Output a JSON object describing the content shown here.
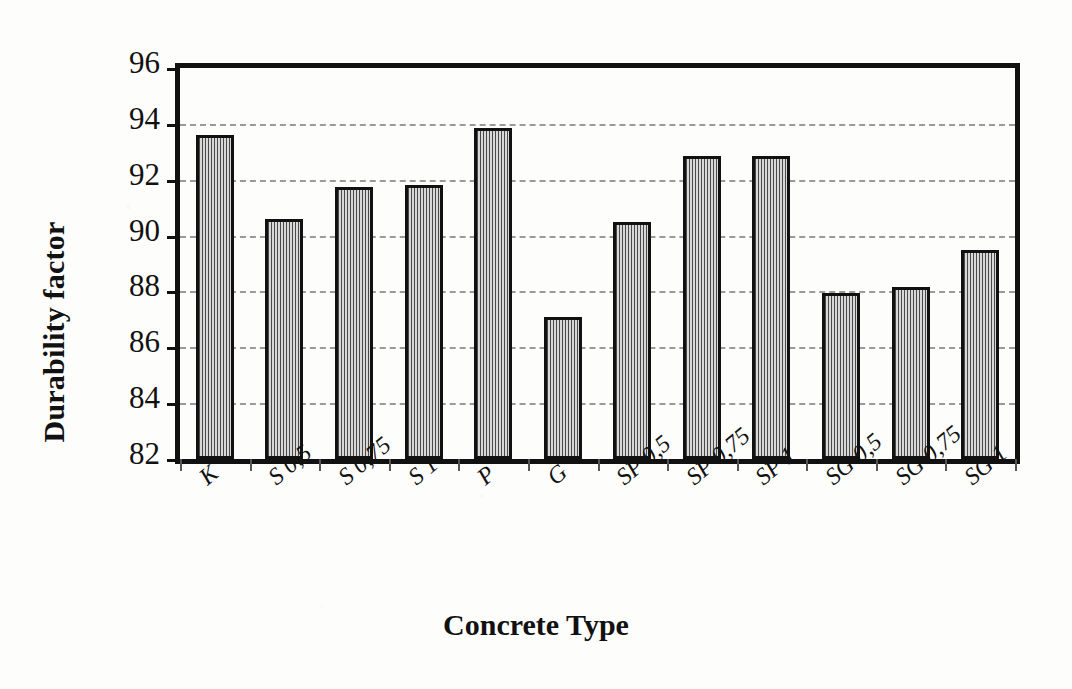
{
  "chart_data": {
    "type": "bar",
    "title": "",
    "xlabel": "Concrete Type",
    "ylabel": "Durability factor",
    "categories": [
      "K",
      "S 0,5",
      "S 0,75",
      "S 1",
      "P",
      "G",
      "SP 0,5",
      "SP 0,75",
      "SP 1",
      "SG 0,5",
      "SG 0,75",
      "SG 1"
    ],
    "values": [
      93.6,
      90.6,
      91.75,
      91.8,
      93.85,
      87.1,
      90.5,
      92.85,
      92.85,
      87.95,
      88.15,
      89.5
    ],
    "ylim": [
      82,
      96
    ],
    "ytick_labels": [
      "96",
      "94",
      "92",
      "90",
      "88",
      "86",
      "84",
      "82"
    ],
    "ytick_values": [
      96,
      94,
      92,
      90,
      88,
      86,
      84,
      82
    ],
    "grid": "horizontal-dashed",
    "legend": "none",
    "bar_fill": "vertical-hatch",
    "bar_edge_color": "#111111",
    "gridline_color": "#9a9a9a",
    "plot_border_color": "#111111",
    "background_color": "#fdfdfb"
  }
}
